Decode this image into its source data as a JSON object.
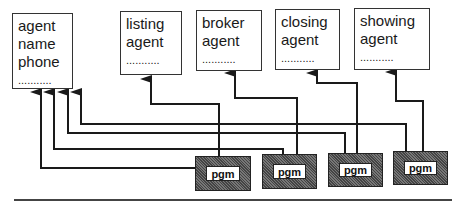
{
  "diagram": {
    "entities": [
      {
        "id": "agent",
        "lines": [
          "agent",
          "name",
          "phone"
        ],
        "dots": "..........."
      },
      {
        "id": "listing-agent",
        "lines": [
          "listing",
          "agent"
        ],
        "dots": "..........."
      },
      {
        "id": "broker-agent",
        "lines": [
          "broker",
          "agent"
        ],
        "dots": "..........."
      },
      {
        "id": "closing-agent",
        "lines": [
          "closing",
          "agent"
        ],
        "dots": "..........."
      },
      {
        "id": "showing-agent",
        "lines": [
          "showing",
          "agent"
        ],
        "dots": "..........."
      }
    ],
    "programs": [
      {
        "label": "pgm"
      },
      {
        "label": "pgm"
      },
      {
        "label": "pgm"
      },
      {
        "label": "pgm"
      }
    ],
    "connections": [
      {
        "from": "pgm-1",
        "to": "agent"
      },
      {
        "from": "pgm-1",
        "to": "listing-agent"
      },
      {
        "from": "pgm-2",
        "to": "agent"
      },
      {
        "from": "pgm-2",
        "to": "broker-agent"
      },
      {
        "from": "pgm-3",
        "to": "agent"
      },
      {
        "from": "pgm-3",
        "to": "closing-agent"
      },
      {
        "from": "pgm-4",
        "to": "agent"
      },
      {
        "from": "pgm-4",
        "to": "showing-agent"
      }
    ],
    "colors": {
      "line": "#1a1a1a",
      "pgm_fill": "#666666",
      "box_border": "#333333"
    }
  }
}
